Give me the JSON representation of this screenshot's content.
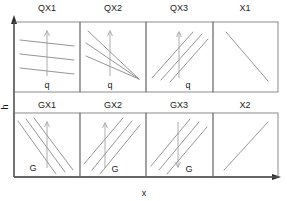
{
  "figure": {
    "axes": {
      "y_label": "h",
      "x_label": "x"
    },
    "panels": [
      {
        "id": "qx1",
        "title": "QX1",
        "row": 0,
        "col": 0,
        "shift_label": "q",
        "shift_arrow_direction": "up",
        "curve_count": 3,
        "curve_slope": "slightly-negative",
        "curve_pattern": "parallel"
      },
      {
        "id": "qx2",
        "title": "QX2",
        "row": 0,
        "col": 1,
        "shift_label": "q",
        "shift_arrow_direction": "up",
        "curve_count": 3,
        "curve_slope": "negative",
        "curve_pattern": "fan-converging-lower-right"
      },
      {
        "id": "qx3",
        "title": "QX3",
        "row": 0,
        "col": 2,
        "shift_label": "q",
        "shift_arrow_direction": "up",
        "curve_count": 3,
        "curve_slope": "positive",
        "curve_pattern": "parallel"
      },
      {
        "id": "x1",
        "title": "X1",
        "row": 0,
        "col": 3,
        "shift_label": "",
        "shift_arrow_direction": "none",
        "curve_count": 1,
        "curve_slope": "negative",
        "curve_pattern": "single"
      },
      {
        "id": "gx1",
        "title": "GX1",
        "row": 1,
        "col": 0,
        "shift_label": "G",
        "shift_arrow_direction": "up",
        "curve_count": 3,
        "curve_slope": "negative",
        "curve_pattern": "parallel"
      },
      {
        "id": "gx2",
        "title": "GX2",
        "row": 1,
        "col": 1,
        "shift_label": "G",
        "shift_arrow_direction": "up",
        "curve_count": 3,
        "curve_slope": "positive",
        "curve_pattern": "parallel"
      },
      {
        "id": "gx3",
        "title": "GX3",
        "row": 1,
        "col": 2,
        "shift_label": "G",
        "shift_arrow_direction": "down",
        "curve_count": 3,
        "curve_slope": "positive",
        "curve_pattern": "parallel"
      },
      {
        "id": "x2",
        "title": "X2",
        "row": 1,
        "col": 3,
        "shift_label": "",
        "shift_arrow_direction": "none",
        "curve_count": 1,
        "curve_slope": "positive",
        "curve_pattern": "single"
      }
    ]
  },
  "colors": {
    "axis": "#2b2b2b",
    "frame": "#6e6e6e",
    "curve": "#8a8a8a",
    "annotation": "#9a9a9a",
    "text": "#1a1a1a",
    "background": "#ffffff"
  }
}
